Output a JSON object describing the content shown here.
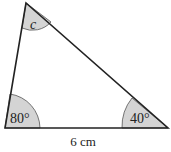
{
  "diagram": {
    "type": "triangle",
    "vertices": {
      "top": {
        "x": 26,
        "y": 3
      },
      "bottom_left": {
        "x": 5,
        "y": 128
      },
      "bottom_right": {
        "x": 168,
        "y": 128
      }
    },
    "angles": [
      {
        "vertex": "top",
        "label": "c",
        "italic": true
      },
      {
        "vertex": "bottom_left",
        "label": "80°"
      },
      {
        "vertex": "bottom_right",
        "label": "40°"
      }
    ],
    "sides": [
      {
        "between": [
          "bottom_left",
          "bottom_right"
        ],
        "label": "6 cm"
      }
    ],
    "colors": {
      "stroke": "#222222",
      "angle_fill": "#d4d4d4"
    }
  }
}
